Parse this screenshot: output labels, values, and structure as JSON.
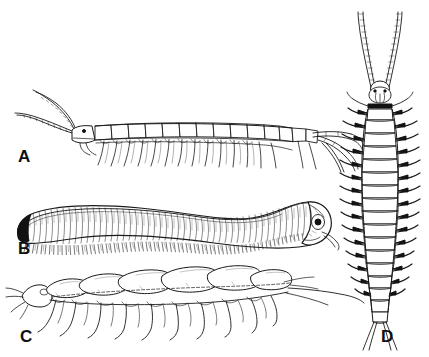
{
  "plate": {
    "title": "Myriapod comparative plate",
    "background_color": "#ffffff",
    "ink_color": "#1a1a1a",
    "label_color": "#101010",
    "panel_count": 4
  },
  "panels": [
    {
      "key": "A",
      "label": "A",
      "subject": "centipede-lateral-view",
      "orientation": "lateral",
      "head_side": "left",
      "antennae": 2,
      "body_segments": 15,
      "leg_pairs": 15,
      "label_x": 18,
      "label_y": 148
    },
    {
      "key": "B",
      "label": "B",
      "subject": "millipede-lateral-view",
      "orientation": "lateral",
      "head_side": "right",
      "antennae": 1,
      "body_segments": 52,
      "leg_pairs": 52,
      "label_x": 18,
      "label_y": 240
    },
    {
      "key": "C",
      "label": "C",
      "subject": "symphylan-lateral-view",
      "orientation": "lateral",
      "head_side": "left",
      "antennae": 1,
      "body_segments": 8,
      "leg_pairs": 9,
      "label_x": 20,
      "label_y": 328
    },
    {
      "key": "D",
      "label": "D",
      "subject": "centipede-dorsal-view",
      "orientation": "dorsal",
      "head_side": "top",
      "antennae": 2,
      "body_segments": 15,
      "leg_pairs": 15,
      "label_x": 381,
      "label_y": 328
    }
  ]
}
